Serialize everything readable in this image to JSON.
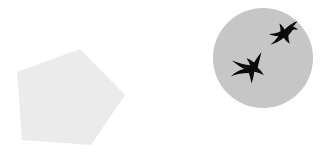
{
  "canvas": {
    "width": 324,
    "height": 167,
    "background_color": "#ffffff",
    "title": "Two abstract shapes: a light gray pentagon and a gray circle containing two black bird silhouettes"
  },
  "shapes": [
    {
      "name": "pentagon",
      "kind": "pentagon",
      "fill_color": "#ebebeb",
      "label": "Pentagon",
      "points": "80,49 17,72 22,140 91,145 125,95",
      "center": {
        "x": 67,
        "y": 100
      },
      "approx_width": 108,
      "approx_height": 96
    },
    {
      "name": "circle",
      "kind": "circle",
      "fill_color": "#c6c6c6",
      "label": "Circle",
      "center": {
        "x": 263,
        "y": 58
      },
      "radius": 50
    }
  ],
  "birds": [
    {
      "name": "bird-upper",
      "label": "Flying bird silhouette (upper right)",
      "fill_color": "#0a0a0a",
      "center": {
        "x": 279,
        "y": 33
      },
      "approx_width": 34,
      "approx_height": 28,
      "path": "M297.5,21.0 C293.0,22.6 288.4,25.8 284.6,29.4 C283.4,27.3 281.7,25.2 279.5,23.6 C280.1,26.3 280.5,28.9 280.6,31.3 C277.1,33.0 273.1,34.1 269.0,34.1 C272.0,35.6 275.2,36.2 278.3,36.1 C276.5,39.2 273.9,42.0 270.4,44.6 C275.2,43.5 279.8,41.0 283.8,37.7 C285.4,40.2 287.4,42.3 289.8,43.7 C288.8,41.0 288.3,38.1 288.4,35.3 C290.0,33.6 291.4,31.8 292.6,29.9 C294.5,29.4 296.4,29.4 298.2,29.9 C296.7,28.2 294.9,27.2 293.1,26.8 C294.8,24.8 296.3,22.9 297.5,21.0 Z"
    },
    {
      "name": "bird-lower",
      "label": "Flying bird silhouette (lower left)",
      "fill_color": "#0a0a0a",
      "center": {
        "x": 247,
        "y": 66
      },
      "approx_width": 38,
      "approx_height": 30,
      "path": "M261.5,52.0 C258.6,55.6 256.1,59.2 254.1,62.4 C251.9,60.6 249.3,59.1 246.5,58.2 C248.2,60.5 249.4,62.9 250.2,65.2 C245.1,64.7 238.9,63.2 231.9,60.5 C236.1,64.1 240.2,66.9 244.1,69.0 C239.0,70.2 234.6,72.6 231.0,76.2 C237.2,73.9 243.1,72.9 248.7,73.0 C250.0,76.1 250.9,79.6 251.4,83.5 C253.0,79.4 253.9,75.5 254.2,71.8 C257.6,72.4 260.8,73.6 263.8,75.3 C262.2,72.2 260.1,69.7 257.6,67.8 C258.9,62.2 260.2,56.9 261.5,52.0 Z"
    }
  ]
}
